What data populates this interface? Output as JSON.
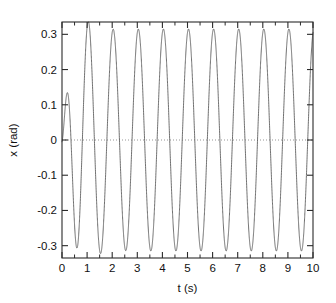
{
  "chart_data": {
    "type": "line",
    "title": "",
    "subtitle": "",
    "xlabel": "t (s)",
    "ylabel": "x (rad)",
    "xlim": [
      0,
      10
    ],
    "ylim": [
      -0.335,
      0.335
    ],
    "xticks": [
      0,
      1,
      2,
      3,
      4,
      5,
      6,
      7,
      8,
      9,
      10
    ],
    "xticklabels": [
      "0",
      "1",
      "2",
      "3",
      "4",
      "5",
      "6",
      "7",
      "8",
      "9",
      "10"
    ],
    "xminorticks": [
      0.5,
      1.5,
      2.5,
      3.5,
      4.5,
      5.5,
      6.5,
      7.5,
      8.5,
      9.5
    ],
    "yticks": [
      -0.3,
      -0.2,
      -0.1,
      0,
      0.1,
      0.2,
      0.3
    ],
    "yticklabels": [
      "-0.3",
      "-0.2",
      "-0.1",
      "0",
      "0.1",
      "0.2",
      "0.3"
    ],
    "grid": false,
    "legend": null,
    "legend_position": "none",
    "zero_reference_line": {
      "y": 0,
      "style": "dotted",
      "color": "#8a8a8a"
    },
    "series": [
      {
        "name": "x(t)",
        "color": "#555555",
        "linewidth": 0.85,
        "description": "Driven damped oscillator reaching steady-state amplitude 0.315 rad with period 1 s; transient first peak 0.177 rad near t=0.2 s",
        "model": {
          "steady_amplitude": 0.315,
          "steady_period": 1.0,
          "steady_phase_peak_at": 0.04,
          "transient_amplitude": 0.33,
          "transient_period": 0.72,
          "transient_decay_time": 0.42,
          "transient_phase_offset": 0.0
        },
        "sample_points": [
          {
            "t": 0.0,
            "x": 0.0
          },
          {
            "t": 0.2,
            "x": 0.177
          },
          {
            "t": 0.58,
            "x": -0.325
          },
          {
            "t": 1.04,
            "x": 0.315
          },
          {
            "t": 1.54,
            "x": -0.315
          },
          {
            "t": 2.04,
            "x": 0.315
          },
          {
            "t": 2.54,
            "x": -0.315
          },
          {
            "t": 3.04,
            "x": 0.315
          },
          {
            "t": 3.54,
            "x": -0.315
          },
          {
            "t": 4.04,
            "x": 0.315
          },
          {
            "t": 4.54,
            "x": -0.315
          },
          {
            "t": 5.04,
            "x": 0.315
          },
          {
            "t": 5.54,
            "x": -0.315
          },
          {
            "t": 6.04,
            "x": 0.315
          },
          {
            "t": 6.54,
            "x": -0.315
          },
          {
            "t": 7.04,
            "x": 0.315
          },
          {
            "t": 7.54,
            "x": -0.315
          },
          {
            "t": 8.04,
            "x": 0.315
          },
          {
            "t": 8.54,
            "x": -0.315
          },
          {
            "t": 9.04,
            "x": 0.315
          },
          {
            "t": 9.54,
            "x": -0.315
          },
          {
            "t": 10.0,
            "x": 0.14
          }
        ]
      }
    ]
  },
  "figure": {
    "background": "#ffffff",
    "axes_color": "#2b2b2b",
    "plot_left_px": 62,
    "plot_right_px": 313,
    "plot_top_px": 22,
    "plot_bottom_px": 258
  }
}
